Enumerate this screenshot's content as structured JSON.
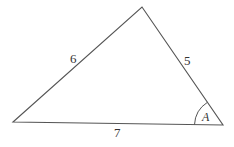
{
  "diagram": {
    "type": "triangle",
    "vertices": {
      "left": [
        13,
        122
      ],
      "apex": [
        142,
        7
      ],
      "right": [
        223,
        125
      ]
    },
    "sides": [
      {
        "name": "left-side",
        "label": "6",
        "from": "left",
        "to": "apex"
      },
      {
        "name": "right-side",
        "label": "5",
        "from": "apex",
        "to": "right"
      },
      {
        "name": "base",
        "label": "7",
        "from": "left",
        "to": "right"
      }
    ],
    "angle": {
      "label": "A",
      "vertex": "right"
    },
    "line_color": "#555555",
    "text_color": "#333333"
  }
}
